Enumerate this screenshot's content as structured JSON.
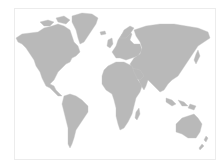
{
  "map": {
    "type": "world-map-silhouette",
    "colors": {
      "background": "#ffffff",
      "land": "#b9b9b9",
      "frame": "#ececec"
    },
    "regions": [
      {
        "id": "north-america",
        "name": "North America"
      },
      {
        "id": "greenland",
        "name": "Greenland"
      },
      {
        "id": "south-america",
        "name": "South America"
      },
      {
        "id": "europe",
        "name": "Europe"
      },
      {
        "id": "africa",
        "name": "Africa"
      },
      {
        "id": "asia",
        "name": "Asia"
      },
      {
        "id": "australia",
        "name": "Australia"
      },
      {
        "id": "madagascar",
        "name": "Madagascar"
      },
      {
        "id": "new-zealand",
        "name": "New Zealand"
      },
      {
        "id": "japan",
        "name": "Japan"
      },
      {
        "id": "uk",
        "name": "United Kingdom"
      },
      {
        "id": "iceland",
        "name": "Iceland"
      },
      {
        "id": "indonesia",
        "name": "Indonesia"
      }
    ]
  }
}
